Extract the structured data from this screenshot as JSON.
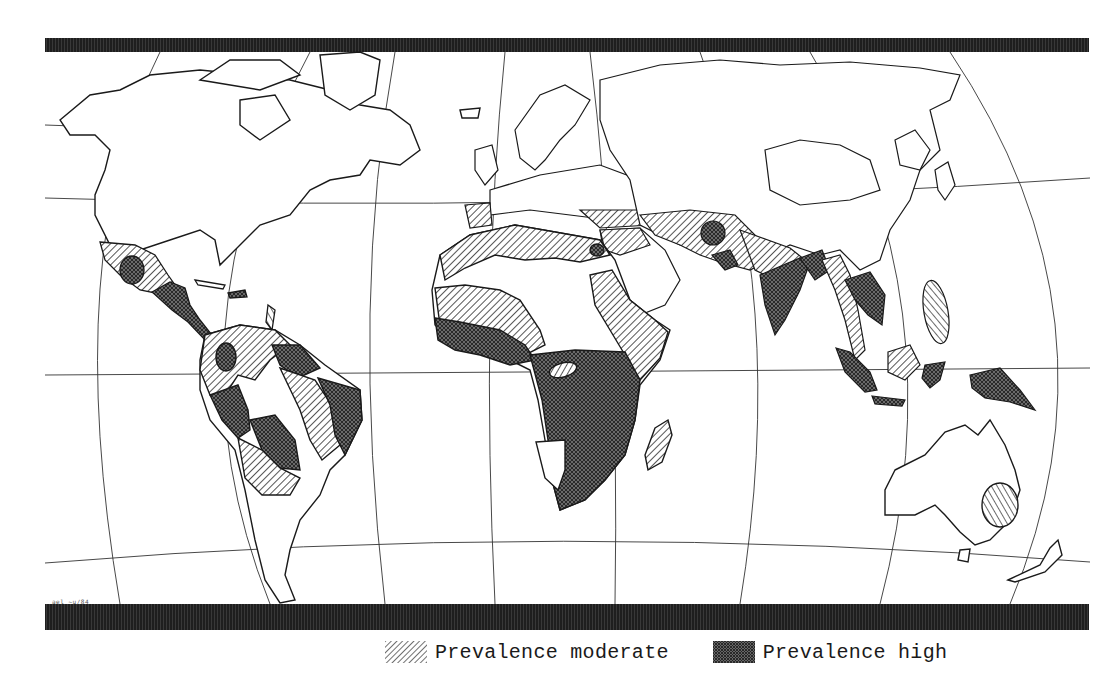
{
  "map": {
    "projection_style": "world map with curved graticule",
    "corner_code": "ael ~u/84",
    "colors": {
      "background": "#ffffff",
      "coast": "#1a1a1a",
      "border_bar": "#1e1e1e",
      "moderate_hatch": "#2a2a2a",
      "high_fill": "#555555"
    },
    "regions": {
      "moderate": [
        "Mexico",
        "Northern South America",
        "Andes",
        "Eastern Brazil coast",
        "North Africa",
        "Sahel",
        "East Africa",
        "Madagascar",
        "Middle East",
        "Central Asia",
        "Northern India",
        "Myanmar",
        "Philippines",
        "Borneo",
        "Southeast Australia"
      ],
      "high": [
        "Central Mexico",
        "Central America",
        "Caribbean",
        "Guianas",
        "Northeast Brazil",
        "Peru",
        "Bolivia",
        "Colombia interior",
        "West Africa coast",
        "Central Africa",
        "Southern Africa",
        "Nile Delta",
        "Iran",
        "Pakistan",
        "Central India",
        "Bangladesh",
        "Indochina",
        "Sumatra",
        "Java",
        "Sulawesi",
        "New Guinea"
      ]
    }
  },
  "legend": {
    "items": [
      {
        "key": "moderate",
        "label": "Prevalence moderate",
        "pattern": "diagonal-hatch"
      },
      {
        "key": "high",
        "label": "Prevalence high",
        "pattern": "crosshatch"
      }
    ]
  }
}
